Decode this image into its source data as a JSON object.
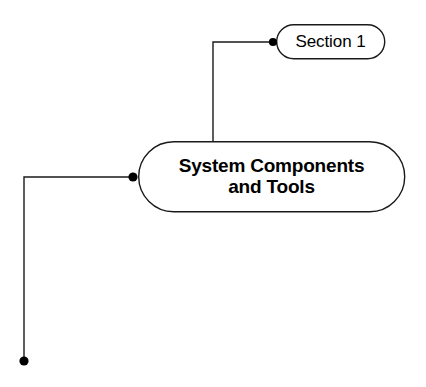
{
  "diagram": {
    "type": "mind-map",
    "background_color": "#ffffff",
    "stroke_color": "#1a1a1a",
    "text_color": "#000000",
    "nodes": [
      {
        "id": "root",
        "label": "System Components\nand Tools",
        "shape": "rounded-rectangle",
        "emphasis": "bold",
        "x": 138,
        "y": 141,
        "width": 267,
        "height": 71
      },
      {
        "id": "section-1",
        "label": "Section 1",
        "shape": "rounded-rectangle",
        "emphasis": "regular",
        "x": 276,
        "y": 24,
        "width": 109,
        "height": 35
      }
    ],
    "connectors": [
      {
        "id": "root-to-section-1",
        "from": "root",
        "to": "section-1",
        "path": "M 213 141 L 213 42 L 273 42",
        "endpoint_dot": {
          "x": 273,
          "y": 42,
          "r": 4
        }
      },
      {
        "id": "root-to-left-branch",
        "from": "root",
        "to": "left-branch-terminal",
        "path": "M 133 177 L 24 177 L 24 361",
        "endpoint_dot": {
          "x": 24,
          "y": 361,
          "r": 4.5
        }
      }
    ],
    "junction_dots": [
      {
        "id": "root-left-junction",
        "x": 133,
        "y": 177,
        "r": 4.5
      }
    ]
  }
}
